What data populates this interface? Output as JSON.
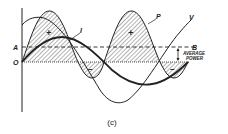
{
  "figure": {
    "caption": "(c)",
    "labels": {
      "origin": "O",
      "level_a": "A",
      "level_b": "B",
      "current": "I",
      "voltage": "V",
      "power": "P",
      "average_power_line1": "AVERAGE",
      "average_power_line2": "POWER",
      "positive_sign": "+",
      "negative_sign": "−"
    },
    "colors": {
      "ink": "#222222",
      "hatch": "#555555",
      "background": "#ffffff"
    }
  }
}
